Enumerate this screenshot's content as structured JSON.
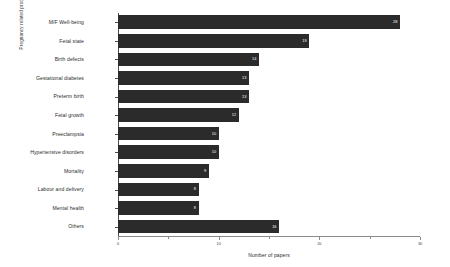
{
  "chart_data": {
    "type": "bar",
    "orientation": "horizontal",
    "title": "",
    "xlabel": "Number of papers",
    "ylabel": "Pregnancy related processes",
    "xlim": [
      0,
      30
    ],
    "grid": false,
    "legend": null,
    "xticks": [
      0,
      5,
      10,
      15,
      20,
      25,
      30
    ],
    "xtick_labels_shown": [
      "0",
      "10",
      "20",
      "30"
    ],
    "xtick_labeled_values": [
      0,
      10,
      20,
      30
    ],
    "bar_color": "#2b2b2b",
    "value_label_color": "#ffffff",
    "categories": [
      "M/F Well-being",
      "Fetal state",
      "Birth defects",
      "Gestational diabetes",
      "Preterm birth",
      "Fetal growth",
      "Preeclampsia",
      "Hypertensive disorders",
      "Mortality",
      "Labour and delivery",
      "Mental health",
      "Others"
    ],
    "values": [
      28,
      19,
      14,
      13,
      13,
      12,
      10,
      10,
      9,
      8,
      8,
      16
    ],
    "bars": [
      {
        "category": "M/F Well-being",
        "value": 28,
        "label": "28"
      },
      {
        "category": "Fetal state",
        "value": 19,
        "label": "19"
      },
      {
        "category": "Birth defects",
        "value": 14,
        "label": "14"
      },
      {
        "category": "Gestational diabetes",
        "value": 13,
        "label": "13"
      },
      {
        "category": "Preterm birth",
        "value": 13,
        "label": "13"
      },
      {
        "category": "Fetal growth",
        "value": 12,
        "label": "12"
      },
      {
        "category": "Preeclampsia",
        "value": 10,
        "label": "10"
      },
      {
        "category": "Hypertensive disorders",
        "value": 10,
        "label": "10"
      },
      {
        "category": "Mortality",
        "value": 9,
        "label": "9"
      },
      {
        "category": "Labour and delivery",
        "value": 8,
        "label": "8"
      },
      {
        "category": "Mental health",
        "value": 8,
        "label": "8"
      },
      {
        "category": "Others",
        "value": 16,
        "label": "16"
      }
    ]
  }
}
